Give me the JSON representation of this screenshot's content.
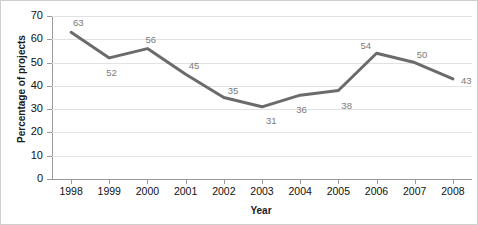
{
  "chart_data": {
    "type": "line",
    "title": "",
    "xlabel": "Year",
    "ylabel": "Percentage of projects",
    "categories": [
      "1998",
      "1999",
      "2000",
      "2001",
      "2002",
      "2003",
      "2004",
      "2005",
      "2006",
      "2007",
      "2008"
    ],
    "values": [
      63,
      52,
      56,
      45,
      35,
      31,
      36,
      38,
      54,
      50,
      43
    ],
    "point_labels": [
      "63",
      "52",
      "56",
      "45",
      "35",
      "31",
      "36",
      "38",
      "54",
      "50",
      "43"
    ],
    "ylim": [
      0,
      70
    ],
    "yticks": [
      0,
      10,
      20,
      30,
      40,
      50,
      60,
      70
    ],
    "ytick_labels": [
      "0",
      "10",
      "20",
      "30",
      "40",
      "50",
      "60",
      "70"
    ],
    "grid": true,
    "grid_axis": "y",
    "legend": false,
    "legend_position": "none",
    "series": [
      {
        "name": "Percentage of projects",
        "values": [
          63,
          52,
          56,
          45,
          35,
          31,
          36,
          38,
          54,
          50,
          43
        ],
        "color": "#6b6b6b",
        "line_width": 3,
        "markers": false
      }
    ],
    "label_offsets": [
      {
        "dx": 2,
        "dy": -15
      },
      {
        "dx": -3,
        "dy": 9
      },
      {
        "dx": -2,
        "dy": -15
      },
      {
        "dx": 3,
        "dy": -14
      },
      {
        "dx": 4,
        "dy": -13
      },
      {
        "dx": 4,
        "dy": 8
      },
      {
        "dx": -4,
        "dy": 9
      },
      {
        "dx": 3,
        "dy": 9
      },
      {
        "dx": -16,
        "dy": -13
      },
      {
        "dx": 2,
        "dy": -14
      },
      {
        "dx": 8,
        "dy": -4
      }
    ]
  },
  "colors": {
    "series": "#6b6b6b",
    "gridline": "#e2e2e2",
    "axis": "#9a9a9a",
    "tick_text": "#111111",
    "label_text": "#7a7a7a",
    "title_text": "#1a1a1a",
    "background": "#ffffff",
    "border": "#cfcfcf"
  }
}
